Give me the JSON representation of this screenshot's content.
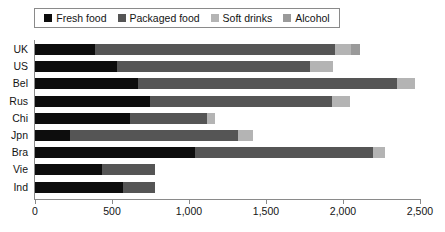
{
  "chart_data": {
    "type": "bar",
    "stacked": true,
    "orientation": "horizontal",
    "title": "",
    "xlabel": "",
    "ylabel": "",
    "xlim": [
      0,
      2500
    ],
    "xticks": [
      0,
      500,
      1000,
      1500,
      2000,
      2500
    ],
    "xtick_labels": [
      "0",
      "500",
      "1,000",
      "1,500",
      "2,000",
      "2,500"
    ],
    "grid": false,
    "legend_position": "top",
    "categories": [
      "UK",
      "US",
      "Bel",
      "Rus",
      "Chi",
      "Jpn",
      "Bra",
      "Vie",
      "Ind"
    ],
    "series": [
      {
        "name": "Fresh food",
        "color": "#0d0d0d",
        "values": [
          390,
          530,
          670,
          745,
          615,
          230,
          1040,
          435,
          570
        ]
      },
      {
        "name": "Packaged food",
        "color": "#555555",
        "values": [
          1560,
          1255,
          1680,
          1185,
          500,
          1090,
          1155,
          345,
          210
        ]
      },
      {
        "name": "Soft drinks",
        "color": "#b4b4b4",
        "values": [
          105,
          150,
          120,
          115,
          55,
          95,
          80,
          0,
          0
        ]
      },
      {
        "name": "Alcohol",
        "color": "#9a9a9a",
        "values": [
          55,
          0,
          0,
          0,
          0,
          0,
          0,
          0,
          0
        ]
      }
    ],
    "totals": [
      2110,
      1935,
      2470,
      2045,
      1170,
      1415,
      2275,
      780,
      780
    ]
  },
  "legend": {
    "items": [
      {
        "label": "Fresh food",
        "color": "#0d0d0d"
      },
      {
        "label": "Packaged food",
        "color": "#555555"
      },
      {
        "label": "Soft drinks",
        "color": "#b4b4b4"
      },
      {
        "label": "Alcohol",
        "color": "#9a9a9a"
      }
    ]
  },
  "axes": {
    "y_labels": [
      "UK",
      "US",
      "Bel",
      "Rus",
      "Chi",
      "Jpn",
      "Bra",
      "Vie",
      "Ind"
    ],
    "x_tick_labels": [
      "0",
      "500",
      "1,000",
      "1,500",
      "2,000",
      "2,500"
    ]
  }
}
